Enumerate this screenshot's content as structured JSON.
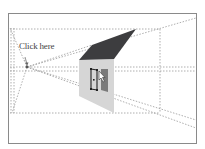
{
  "annotation": {
    "label": "Click here"
  },
  "colors": {
    "frame": "#8a8a8a",
    "guide": "#9a9a9a",
    "roof": "#3d3d3f",
    "wall": "#d6d6d6",
    "window_dark": "#7a7a7a",
    "handles": "#222222",
    "background": "#ffffff"
  },
  "diagram": {
    "frame": {
      "x": 8,
      "y": 13,
      "w": 188,
      "h": 130
    },
    "vanishing_point": {
      "x": 27,
      "y": 67
    },
    "roof": [
      [
        79,
        60
      ],
      [
        92,
        45
      ],
      [
        136,
        29
      ],
      [
        114,
        59
      ]
    ],
    "wall": [
      [
        79,
        60
      ],
      [
        114,
        59
      ],
      [
        114,
        113
      ],
      [
        79,
        96
      ]
    ]
  }
}
